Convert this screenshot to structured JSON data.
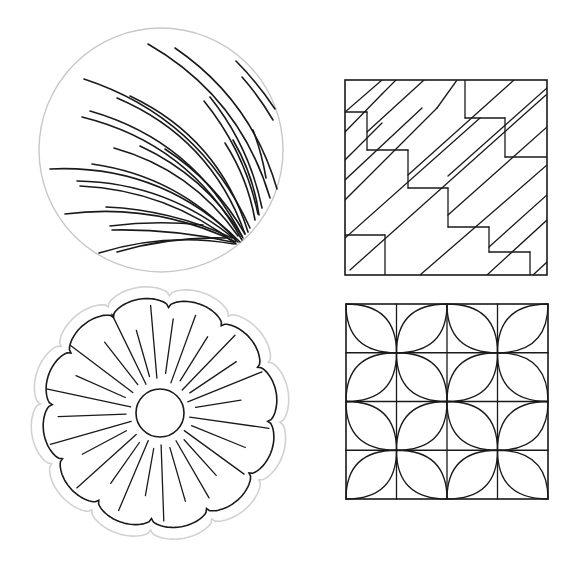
{
  "colors": {
    "background": "#ffffff",
    "line": "#1a1a1a",
    "outline_gray": "#c8c8c8",
    "sticker_outline": "#d2d2d2"
  },
  "designs": [
    {
      "name": "circle-fan-arcs",
      "type": "circle_with_arcs",
      "center": [
        161,
        150
      ],
      "radius": 122,
      "convergence": [
        241,
        242
      ],
      "arcs": [
        {
          "from": [
            148,
            44
          ],
          "to": [
            270,
            198
          ],
          "bend": 0.2
        },
        {
          "from": [
            175,
            48
          ],
          "to": [
            277,
            189
          ],
          "bend": 0.18
        },
        {
          "from": [
            236,
            61
          ],
          "to": [
            275,
            109
          ],
          "bend": 0.05
        },
        {
          "from": [
            242,
            77
          ],
          "to": [
            273,
            120
          ],
          "bend": 0.05
        },
        {
          "from": [
            84,
            79
          ],
          "to": [
            250,
            228
          ],
          "bend": 0.22
        },
        {
          "from": [
            117,
            98
          ],
          "to": [
            245,
            234
          ],
          "bend": 0.22
        },
        {
          "from": [
            130,
            96
          ],
          "to": [
            248,
            232
          ],
          "bend": 0.22
        },
        {
          "from": [
            90,
            111
          ],
          "to": [
            243,
            238
          ],
          "bend": 0.22
        },
        {
          "from": [
            82,
            117
          ],
          "to": [
            242,
            240
          ],
          "bend": 0.22
        },
        {
          "from": [
            204,
            101
          ],
          "to": [
            258,
            214
          ],
          "bend": 0.12
        },
        {
          "from": [
            210,
            97
          ],
          "to": [
            262,
            208
          ],
          "bend": 0.12
        },
        {
          "from": [
            253,
            130
          ],
          "to": [
            266,
            178
          ],
          "bend": 0.05
        },
        {
          "from": [
            225,
            143
          ],
          "to": [
            255,
            220
          ],
          "bend": 0.1
        },
        {
          "from": [
            233,
            140
          ],
          "to": [
            259,
            215
          ],
          "bend": 0.1
        },
        {
          "from": [
            50,
            169
          ],
          "to": [
            240,
            242
          ],
          "bend": 0.22
        },
        {
          "from": [
            114,
            148
          ],
          "to": [
            238,
            236
          ],
          "bend": 0.18
        },
        {
          "from": [
            140,
            146
          ],
          "to": [
            242,
            236
          ],
          "bend": 0.15
        },
        {
          "from": [
            165,
            149
          ],
          "to": [
            245,
            234
          ],
          "bend": 0.12
        },
        {
          "from": [
            92,
            164
          ],
          "to": [
            236,
            240
          ],
          "bend": 0.18
        },
        {
          "from": [
            77,
            181
          ],
          "to": [
            238,
            242
          ],
          "bend": 0.18
        },
        {
          "from": [
            80,
            186
          ],
          "to": [
            236,
            244
          ],
          "bend": 0.16
        },
        {
          "from": [
            65,
            214
          ],
          "to": [
            236,
            242
          ],
          "bend": 0.15
        },
        {
          "from": [
            106,
            207
          ],
          "to": [
            232,
            238
          ],
          "bend": 0.1
        },
        {
          "from": [
            110,
            226
          ],
          "to": [
            203,
            225
          ],
          "bend": 0.06
        },
        {
          "from": [
            112,
            230
          ],
          "to": [
            232,
            242
          ],
          "bend": 0.06
        },
        {
          "from": [
            99,
            253
          ],
          "to": [
            234,
            244
          ],
          "bend": 0.12
        },
        {
          "from": [
            117,
            252
          ],
          "to": [
            226,
            238
          ],
          "bend": 0.08
        }
      ]
    },
    {
      "name": "diagonal-stairs-square",
      "type": "square_pattern",
      "box": [
        345,
        80,
        547,
        275
      ],
      "lines": [
        [
          345,
          112,
          367,
          112
        ],
        [
          367,
          112,
          367,
          150
        ],
        [
          367,
          150,
          408,
          150
        ],
        [
          408,
          150,
          408,
          188
        ],
        [
          408,
          188,
          448,
          188
        ],
        [
          448,
          188,
          448,
          227
        ],
        [
          448,
          227,
          489,
          227
        ],
        [
          489,
          227,
          489,
          252
        ],
        [
          489,
          252,
          530,
          252
        ],
        [
          530,
          252,
          530,
          275
        ],
        [
          345,
          235,
          385,
          235
        ],
        [
          385,
          235,
          385,
          275
        ],
        [
          465,
          80,
          465,
          118
        ],
        [
          465,
          118,
          505,
          118
        ],
        [
          505,
          118,
          505,
          157
        ],
        [
          505,
          157,
          547,
          157
        ],
        [
          345,
          132,
          382,
          94
        ],
        [
          345,
          160,
          382,
          123
        ],
        [
          382,
          94,
          396,
          80
        ],
        [
          345,
          200,
          437,
          108
        ],
        [
          437,
          108,
          457,
          80
        ],
        [
          345,
          238,
          480,
          118
        ],
        [
          350,
          270,
          546,
          95
        ],
        [
          420,
          275,
          547,
          165
        ],
        [
          487,
          275,
          547,
          220
        ],
        [
          533,
          275,
          547,
          262
        ],
        [
          345,
          180,
          422,
          108
        ],
        [
          382,
          80,
          345,
          112
        ],
        [
          424,
          80,
          367,
          132
        ],
        [
          514,
          80,
          408,
          175
        ],
        [
          547,
          88,
          448,
          176
        ],
        [
          547,
          127,
          448,
          215
        ],
        [
          547,
          195,
          489,
          247
        ]
      ]
    },
    {
      "name": "orange-peel-grid-square",
      "type": "orange_peel",
      "box": [
        346,
        304,
        548,
        499
      ],
      "grid": 4,
      "petal_cells": [
        [
          0,
          0,
          "tl-br"
        ],
        [
          1,
          0,
          "tr-bl"
        ],
        [
          2,
          0,
          "tl-br"
        ],
        [
          3,
          0,
          "tr-bl"
        ],
        [
          0,
          1,
          "tr-bl"
        ],
        [
          1,
          1,
          "tl-br"
        ],
        [
          2,
          1,
          "tr-bl"
        ],
        [
          3,
          1,
          "tl-br"
        ],
        [
          0,
          2,
          "tl-br"
        ],
        [
          1,
          2,
          "tr-bl"
        ],
        [
          2,
          2,
          "tl-br"
        ],
        [
          3,
          2,
          "tr-bl"
        ],
        [
          0,
          3,
          "tr-bl"
        ],
        [
          1,
          3,
          "tl-br"
        ],
        [
          2,
          3,
          "tr-bl"
        ],
        [
          3,
          3,
          "tl-br"
        ]
      ]
    },
    {
      "name": "scalloped-flower",
      "type": "scalloped_flower",
      "center": [
        160,
        413
      ],
      "inner_radius": 24,
      "scallop_count": 12,
      "outer_radius": 118,
      "scallop_depth": 10,
      "sticker_pad": 12,
      "rays": [
        {
          "angle": -95,
          "r1": 35,
          "r2": 108
        },
        {
          "angle": -82,
          "r1": 40,
          "r2": 95
        },
        {
          "angle": -70,
          "r1": 32,
          "r2": 104
        },
        {
          "angle": -58,
          "r1": 38,
          "r2": 90
        },
        {
          "angle": -46,
          "r1": 32,
          "r2": 108
        },
        {
          "angle": -34,
          "r1": 36,
          "r2": 92
        },
        {
          "angle": -22,
          "r1": 30,
          "r2": 110
        },
        {
          "angle": -9,
          "r1": 36,
          "r2": 82
        },
        {
          "angle": 8,
          "r1": 30,
          "r2": 110
        },
        {
          "angle": 22,
          "r1": 34,
          "r2": 92
        },
        {
          "angle": 36,
          "r1": 30,
          "r2": 104
        },
        {
          "angle": 48,
          "r1": 36,
          "r2": 84
        },
        {
          "angle": 60,
          "r1": 32,
          "r2": 98
        },
        {
          "angle": 74,
          "r1": 36,
          "r2": 92
        },
        {
          "angle": 88,
          "r1": 32,
          "r2": 108
        },
        {
          "angle": 100,
          "r1": 36,
          "r2": 84
        },
        {
          "angle": 113,
          "r1": 30,
          "r2": 106
        },
        {
          "angle": 125,
          "r1": 36,
          "r2": 86
        },
        {
          "angle": 138,
          "r1": 32,
          "r2": 112
        },
        {
          "angle": 152,
          "r1": 38,
          "r2": 88
        },
        {
          "angle": 164,
          "r1": 30,
          "r2": 114
        },
        {
          "angle": 178,
          "r1": 34,
          "r2": 102
        },
        {
          "angle": -168,
          "r1": 30,
          "r2": 116
        },
        {
          "angle": -156,
          "r1": 38,
          "r2": 92
        },
        {
          "angle": -143,
          "r1": 34,
          "r2": 112
        },
        {
          "angle": -128,
          "r1": 36,
          "r2": 90
        },
        {
          "angle": -116,
          "r1": 32,
          "r2": 110
        },
        {
          "angle": -106,
          "r1": 38,
          "r2": 86
        }
      ]
    }
  ]
}
